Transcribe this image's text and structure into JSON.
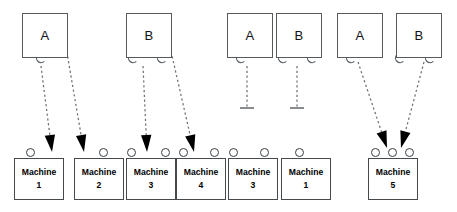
{
  "diagram": {
    "type": "uml-deployment",
    "canvas": {
      "width": 457,
      "height": 212
    },
    "colors": {
      "background": "#ffffff",
      "box_stroke": "#555a5e",
      "machine_stroke": "#444a4e",
      "connector_stroke": "#5a5f63",
      "dashed_line": "#6b7074",
      "arrowhead_fill": "#000000",
      "port_fill": "#ffffff",
      "text": "#000000"
    }
  },
  "components": [
    {
      "id": "comp-1",
      "label": "A",
      "x": 22,
      "y": 13,
      "w": 44,
      "h": 43,
      "sockets": [
        {
          "cx": 41,
          "cy": 58
        }
      ]
    },
    {
      "id": "comp-2",
      "label": "B",
      "x": 126,
      "y": 13,
      "w": 44,
      "h": 43,
      "sockets": [
        {
          "cx": 133,
          "cy": 58
        },
        {
          "cx": 162,
          "cy": 58
        }
      ]
    },
    {
      "id": "comp-3",
      "label": "A",
      "x": 227,
      "y": 13,
      "w": 44,
      "h": 43,
      "sockets": [
        {
          "cx": 241,
          "cy": 58
        }
      ]
    },
    {
      "id": "comp-4",
      "label": "B",
      "x": 276,
      "y": 13,
      "w": 44,
      "h": 43,
      "sockets": [
        {
          "cx": 283,
          "cy": 58
        },
        {
          "cx": 312,
          "cy": 58
        }
      ]
    },
    {
      "id": "comp-5",
      "label": "A",
      "x": 337,
      "y": 13,
      "w": 44,
      "h": 43,
      "sockets": [
        {
          "cx": 351,
          "cy": 58
        }
      ]
    },
    {
      "id": "comp-6",
      "label": "B",
      "x": 396,
      "y": 13,
      "w": 44,
      "h": 43,
      "sockets": [
        {
          "cx": 400,
          "cy": 58
        },
        {
          "cx": 430,
          "cy": 58
        }
      ]
    }
  ],
  "machines": [
    {
      "id": "machine-1",
      "name": "Machine",
      "number": "1",
      "x": 14,
      "y": 158,
      "w": 48,
      "h": 40,
      "ports": [
        {
          "cx": 30
        }
      ]
    },
    {
      "id": "machine-2",
      "name": "Machine",
      "number": "2",
      "x": 74,
      "y": 158,
      "w": 48,
      "h": 40,
      "ports": [
        {
          "cx": 103
        }
      ]
    },
    {
      "id": "machine-3",
      "name": "Machine",
      "number": "3",
      "x": 126,
      "y": 158,
      "w": 48,
      "h": 40,
      "ports": [
        {
          "cx": 131
        },
        {
          "cx": 165
        }
      ]
    },
    {
      "id": "machine-4",
      "name": "Machine",
      "number": "4",
      "x": 176,
      "y": 158,
      "w": 48,
      "h": 40,
      "ports": [
        {
          "cx": 183
        },
        {
          "cx": 214
        }
      ]
    },
    {
      "id": "machine-5",
      "name": "Machine",
      "number": "3",
      "x": 228,
      "y": 158,
      "w": 48,
      "h": 40,
      "ports": [
        {
          "cx": 233
        },
        {
          "cx": 264
        }
      ]
    },
    {
      "id": "machine-6",
      "name": "Machine",
      "number": "1",
      "x": 281,
      "y": 158,
      "w": 48,
      "h": 40,
      "ports": [
        {
          "cx": 299
        }
      ]
    },
    {
      "id": "machine-7",
      "name": "Machine",
      "number": "5",
      "x": 368,
      "y": 158,
      "w": 48,
      "h": 40,
      "ports": [
        {
          "cx": 375
        },
        {
          "cx": 392
        },
        {
          "cx": 409
        }
      ]
    }
  ],
  "connections": [
    {
      "id": "conn-a1-m1",
      "from": "comp-1",
      "to": "machine-1",
      "style": "dashed",
      "end": "arrow",
      "x1": 41,
      "y1": 66,
      "x2": 52,
      "y2": 152
    },
    {
      "id": "conn-a1-m2",
      "from": "comp-1",
      "to": "machine-2",
      "style": "dashed",
      "end": "arrow",
      "x1": 66,
      "y1": 47,
      "x2": 84,
      "y2": 152
    },
    {
      "id": "conn-b2-m3",
      "from": "comp-2",
      "to": "machine-3",
      "style": "dashed",
      "end": "arrow",
      "x1": 143,
      "y1": 66,
      "x2": 147,
      "y2": 152
    },
    {
      "id": "conn-b2-m4",
      "from": "comp-2",
      "to": "machine-4",
      "style": "dashed",
      "end": "arrow",
      "x1": 170,
      "y1": 47,
      "x2": 194,
      "y2": 152
    },
    {
      "id": "conn-a3-open",
      "from": "comp-3",
      "to": null,
      "style": "dashed",
      "end": "terminator",
      "x1": 247,
      "y1": 66,
      "x2": 247,
      "y2": 108
    },
    {
      "id": "conn-b4-open",
      "from": "comp-4",
      "to": null,
      "style": "dashed",
      "end": "terminator",
      "x1": 297,
      "y1": 66,
      "x2": 297,
      "y2": 108
    },
    {
      "id": "conn-a5-m5",
      "from": "comp-5",
      "to": "machine-7",
      "style": "dashed",
      "end": "arrow",
      "x1": 358,
      "y1": 62,
      "x2": 387,
      "y2": 148
    },
    {
      "id": "conn-b6-m5",
      "from": "comp-6",
      "to": "machine-7",
      "style": "dashed",
      "end": "arrow",
      "x1": 424,
      "y1": 62,
      "x2": 401,
      "y2": 148
    }
  ]
}
